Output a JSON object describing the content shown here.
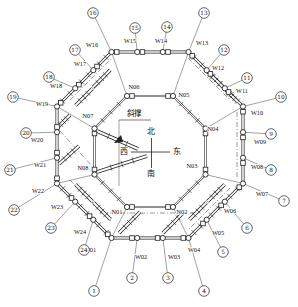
{
  "diagram": {
    "bg_color": "#ffffff",
    "line_color": "#222222",
    "thin_line_color": "#444444",
    "compass": {
      "north": "北",
      "south": "南",
      "east": "东",
      "west": "西",
      "cx": 151.5,
      "cy": 152,
      "h_x1": 131,
      "h_x2": 170,
      "v_y1": 138,
      "v_y2": 168,
      "north_x": 151,
      "north_y": 134,
      "south_x": 151,
      "south_y": 176,
      "west_x": 124,
      "west_y": 154,
      "east_x": 177,
      "east_y": 154
    },
    "brace_callout": {
      "label": "斜撑",
      "tx": 134,
      "ty": 116,
      "underline": [
        119,
        120,
        151,
        120
      ],
      "leader": [
        119,
        120,
        119,
        186
      ],
      "arrow": [
        114,
        143,
        121,
        135,
        123,
        142
      ]
    },
    "outer_wall_corners": [
      111.5,
      52,
      188.5,
      52,
      243,
      106.5,
      243,
      183.5,
      188.5,
      238,
      111.5,
      238,
      57,
      183.5,
      57,
      106.5
    ],
    "inner_ring_corners": [
      127,
      96,
      173,
      96,
      205.5,
      128.5,
      205.5,
      174.5,
      173,
      207,
      127,
      207,
      94.5,
      174.5,
      94.5,
      128.5
    ],
    "outer_points": [
      {
        "id": "W01",
        "x": 111.5,
        "y": 238,
        "lx": 90,
        "ly": 252,
        "num": "1",
        "nx": 94,
        "ny": 291,
        "sdx": -3.7,
        "sdy": -3.7
      },
      {
        "id": "W02",
        "x": 137.2,
        "y": 238,
        "lx": 141,
        "ly": 259,
        "num": "2",
        "nx": 132,
        "ny": 278,
        "sdx": -5.2,
        "sdy": 0
      },
      {
        "id": "W03",
        "x": 162.8,
        "y": 238,
        "lx": 174,
        "ly": 259,
        "num": "3",
        "nx": 168,
        "ny": 278,
        "sdx": -5.2,
        "sdy": 0
      },
      {
        "id": "W04",
        "x": 188.5,
        "y": 238,
        "lx": 194,
        "ly": 252,
        "num": "4",
        "nx": 204,
        "ny": 291,
        "sdx": -5.2,
        "sdy": 0
      },
      {
        "id": "W05",
        "x": 206.7,
        "y": 219.8,
        "lx": 218,
        "ly": 235,
        "num": "5",
        "nx": 223,
        "ny": 252,
        "sdx": -3.7,
        "sdy": 3.7
      },
      {
        "id": "W06",
        "x": 224.8,
        "y": 201.7,
        "lx": 230,
        "ly": 213,
        "num": "6",
        "nx": 247,
        "ny": 228,
        "sdx": -3.7,
        "sdy": 3.7
      },
      {
        "id": "W07",
        "x": 243,
        "y": 183.5,
        "lx": 262,
        "ly": 196,
        "num": "7",
        "nx": 284,
        "ny": 201,
        "sdx": -3.7,
        "sdy": 3.7
      },
      {
        "id": "W08",
        "x": 243,
        "y": 157.8,
        "lx": 257,
        "ly": 169,
        "num": "8",
        "nx": 271,
        "ny": 170,
        "sdx": 0,
        "sdy": 5.2
      },
      {
        "id": "W09",
        "x": 243,
        "y": 132.2,
        "lx": 260,
        "ly": 144,
        "num": "9",
        "nx": 271,
        "ny": 134,
        "sdx": 0,
        "sdy": 5.2
      },
      {
        "id": "W10",
        "x": 243,
        "y": 106.5,
        "lx": 257,
        "ly": 115,
        "num": "10",
        "nx": 281,
        "ny": 97,
        "sdx": 0,
        "sdy": 5.2
      },
      {
        "id": "W11",
        "x": 224.8,
        "y": 88.3,
        "lx": 242,
        "ly": 93,
        "num": "11",
        "nx": 247,
        "ny": 78,
        "sdx": 3.7,
        "sdy": 3.7
      },
      {
        "id": "W12",
        "x": 206.7,
        "y": 70.2,
        "lx": 218,
        "ly": 70,
        "num": "12",
        "nx": 224,
        "ny": 50,
        "sdx": 3.7,
        "sdy": 3.7
      },
      {
        "id": "W13",
        "x": 188.5,
        "y": 52,
        "lx": 202,
        "ly": 45,
        "num": "13",
        "nx": 204,
        "ny": 13,
        "sdx": 3.7,
        "sdy": 3.7
      },
      {
        "id": "W14",
        "x": 162.8,
        "y": 52,
        "lx": 161,
        "ly": 43,
        "num": "14",
        "nx": 167,
        "ny": 27,
        "sdx": 5.2,
        "sdy": 0
      },
      {
        "id": "W15",
        "x": 137.2,
        "y": 52,
        "lx": 130,
        "ly": 43,
        "num": "15",
        "nx": 135,
        "ny": 28,
        "sdx": 5.2,
        "sdy": 0
      },
      {
        "id": "W16",
        "x": 111.5,
        "y": 52,
        "lx": 92,
        "ly": 47,
        "num": "16",
        "nx": 93,
        "ny": 13,
        "sdx": 5.2,
        "sdy": 0
      },
      {
        "id": "W17",
        "x": 93.3,
        "y": 70.2,
        "lx": 80,
        "ly": 66,
        "num": "17",
        "nx": 75,
        "ny": 50,
        "sdx": 3.7,
        "sdy": -3.7
      },
      {
        "id": "W18",
        "x": 75.2,
        "y": 88.3,
        "lx": 56,
        "ly": 88,
        "num": "18",
        "nx": 49,
        "ny": 77,
        "sdx": 3.7,
        "sdy": -3.7
      },
      {
        "id": "W19",
        "x": 57,
        "y": 106.5,
        "lx": 42,
        "ly": 106,
        "num": "19",
        "nx": 13,
        "ny": 97,
        "sdx": 3.7,
        "sdy": -3.7
      },
      {
        "id": "W20",
        "x": 57,
        "y": 132.2,
        "lx": 37,
        "ly": 142,
        "num": "20",
        "nx": 26,
        "ny": 133,
        "sdx": 0,
        "sdy": -5.2
      },
      {
        "id": "W21",
        "x": 57,
        "y": 157.8,
        "lx": 40,
        "ly": 167,
        "num": "21",
        "nx": 10,
        "ny": 170,
        "sdx": 0,
        "sdy": -5.2
      },
      {
        "id": "W22",
        "x": 57,
        "y": 183.5,
        "lx": 38,
        "ly": 193,
        "num": "22",
        "nx": 14,
        "ny": 210,
        "sdx": 0,
        "sdy": -5.2
      },
      {
        "id": "W23",
        "x": 75.2,
        "y": 201.7,
        "lx": 57,
        "ly": 209,
        "num": "23",
        "nx": 51,
        "ny": 228,
        "sdx": -3.7,
        "sdy": -3.7
      },
      {
        "id": "W24",
        "x": 93.3,
        "y": 219.8,
        "lx": 80,
        "ly": 234,
        "num": "24",
        "nx": 84,
        "ny": 250,
        "sdx": -3.7,
        "sdy": -3.7
      }
    ],
    "inner_points": [
      {
        "id": "N01",
        "x": 127,
        "y": 207,
        "lx": 117,
        "ly": 214,
        "sdx": 5,
        "sdy": 0
      },
      {
        "id": "N02",
        "x": 173,
        "y": 207,
        "lx": 182,
        "ly": 214,
        "sdx": -5,
        "sdy": 0
      },
      {
        "id": "N03",
        "x": 205.5,
        "y": 174.5,
        "lx": 192,
        "ly": 168,
        "sdx": 0,
        "sdy": -5
      },
      {
        "id": "N04",
        "x": 205.5,
        "y": 128.5,
        "lx": 213,
        "ly": 131,
        "sdx": 0,
        "sdy": 5
      },
      {
        "id": "N05",
        "x": 173,
        "y": 96,
        "lx": 184,
        "ly": 97,
        "sdx": -5,
        "sdy": 0
      },
      {
        "id": "N06",
        "x": 127,
        "y": 96,
        "lx": 134,
        "ly": 89,
        "sdx": 5,
        "sdy": 0
      },
      {
        "id": "N07",
        "x": 94.5,
        "y": 128.5,
        "lx": 88,
        "ly": 118,
        "sdx": 0,
        "sdy": 5
      },
      {
        "id": "N08",
        "x": 94.5,
        "y": 174.5,
        "lx": 83,
        "ly": 170,
        "sdx": 0,
        "sdy": -5
      }
    ],
    "corner_links": [
      [
        "W01",
        "N01"
      ],
      [
        "W04",
        "N02"
      ],
      [
        "W07",
        "N03"
      ],
      [
        "W10",
        "N04"
      ],
      [
        "W13",
        "N05"
      ],
      [
        "W16",
        "N06"
      ],
      [
        "W19",
        "N07"
      ],
      [
        "W22",
        "N08"
      ]
    ],
    "ring_braces": [
      [
        119,
        233,
        140,
        212
      ],
      [
        163,
        233,
        184,
        212
      ],
      [
        57,
        128,
        70,
        115
      ],
      [
        59,
        164,
        79,
        146
      ],
      [
        75.5,
        184.5,
        92.5,
        201.5
      ],
      [
        93.5,
        202.5,
        110.5,
        219.5
      ],
      [
        75.5,
        105.5,
        92.5,
        88.5
      ],
      [
        93,
        87.4,
        110.3,
        70
      ],
      [
        207.5,
        71.5,
        224.5,
        88.5
      ],
      [
        226,
        90,
        238,
        102
      ],
      [
        224.5,
        184.5,
        207.5,
        201.5
      ],
      [
        206.5,
        202.5,
        189.5,
        219.5
      ]
    ],
    "interior_braces": [
      [
        97,
        131,
        138,
        149
      ],
      [
        97,
        172,
        147,
        156
      ]
    ],
    "dashdot_segments": [
      [
        100,
        213,
        200,
        213
      ],
      [
        60,
        131,
        92,
        166
      ],
      [
        70,
        180,
        112,
        222
      ],
      [
        70,
        100,
        112,
        58
      ],
      [
        188,
        58,
        230,
        100
      ],
      [
        230,
        188,
        188,
        230
      ],
      [
        237,
        112,
        237,
        178
      ]
    ],
    "outer_diagonal_walls": [
      [
        57,
        106.5,
        111.5,
        52
      ],
      [
        188.5,
        52,
        243,
        106.5
      ],
      [
        243,
        183.5,
        188.5,
        238
      ],
      [
        111.5,
        238,
        57,
        183.5
      ]
    ],
    "inner_diagonal_walls": [
      [
        127,
        96,
        94.5,
        128.5
      ],
      [
        173,
        96,
        205.5,
        128.5
      ],
      [
        205.5,
        174.5,
        173,
        207
      ],
      [
        127,
        207,
        94.5,
        174.5
      ]
    ]
  }
}
